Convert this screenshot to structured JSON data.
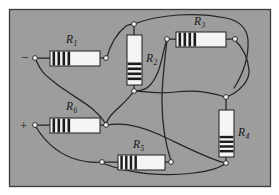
{
  "figure": {
    "panel": {
      "background_color": "#9d9d9d",
      "border_color": "#3c3c3c",
      "outer_background_color": "#ffffff",
      "x": 9,
      "y": 9,
      "width": 261,
      "height": 177
    },
    "wire_color": "#242424",
    "node_fill_color": "#f2f2f2",
    "node_stroke_color": "#1e1e1e",
    "resistor_body_color": "#f4f4f2",
    "resistor_band_color": "#1c1c1c",
    "resistor_outline_color": "#1e1e1e",
    "lead_color": "#242424"
  },
  "terminals": [
    {
      "id": "terminal-negative",
      "label": "−",
      "name": "negative-terminal",
      "label_x": 21,
      "label_y": 62,
      "node_x": 35,
      "node_y": 58
    },
    {
      "id": "terminal-positive",
      "label": "+",
      "name": "positive-terminal",
      "label_x": 20,
      "label_y": 130,
      "node_x": 35,
      "node_y": 125
    }
  ],
  "resistors": [
    {
      "id": "R1",
      "label": "R",
      "subscript": "1",
      "orientation": "horizontal",
      "x": 50,
      "y": 51,
      "width": 50,
      "height": 15,
      "bands": 4,
      "band_side": "start",
      "label_x": 66,
      "label_y": 43,
      "sub_dx": 8,
      "sub_dy": 3
    },
    {
      "id": "R2",
      "label": "R",
      "subscript": "2",
      "orientation": "vertical",
      "x": 127,
      "y": 35,
      "width": 15,
      "height": 50,
      "bands": 4,
      "band_side": "end",
      "label_x": 146,
      "label_y": 62,
      "sub_dx": 8,
      "sub_dy": 3
    },
    {
      "id": "R3",
      "label": "R",
      "subscript": "3",
      "orientation": "horizontal",
      "x": 176,
      "y": 32,
      "width": 50,
      "height": 15,
      "bands": 4,
      "band_side": "start",
      "label_x": 194,
      "label_y": 25,
      "sub_dx": 8,
      "sub_dy": 3
    },
    {
      "id": "R4",
      "label": "R",
      "subscript": "4",
      "orientation": "vertical",
      "x": 219,
      "y": 110,
      "width": 15,
      "height": 47,
      "bands": 4,
      "band_side": "end",
      "label_x": 238,
      "label_y": 136,
      "sub_dx": 8,
      "sub_dy": 3
    },
    {
      "id": "R5",
      "label": "R",
      "subscript": "5",
      "orientation": "horizontal",
      "x": 118,
      "y": 155,
      "width": 47,
      "height": 15,
      "bands": 4,
      "band_side": "start",
      "label_x": 133,
      "label_y": 148,
      "sub_dx": 8,
      "sub_dy": 3
    },
    {
      "id": "R6",
      "label": "R",
      "subscript": "6",
      "orientation": "horizontal",
      "x": 50,
      "y": 118,
      "width": 50,
      "height": 15,
      "bands": 4,
      "band_side": "start",
      "label_x": 66,
      "label_y": 110,
      "sub_dx": 8,
      "sub_dy": 3
    }
  ],
  "nodes": [
    {
      "id": "n-neg",
      "name": "node-negative-terminal",
      "x": 35,
      "y": 58
    },
    {
      "id": "n-r1-right",
      "name": "node-r1-right",
      "x": 106,
      "y": 58
    },
    {
      "id": "n-top-center",
      "name": "node-top-center",
      "x": 134,
      "y": 24
    },
    {
      "id": "n-r2-bottom",
      "name": "node-r2-bottom",
      "x": 134,
      "y": 91
    },
    {
      "id": "n-r3-left",
      "name": "node-r3-left",
      "x": 167,
      "y": 39
    },
    {
      "id": "n-r3-right",
      "name": "node-r3-right",
      "x": 235,
      "y": 39
    },
    {
      "id": "n-r4-top",
      "name": "node-r4-top",
      "x": 226,
      "y": 97
    },
    {
      "id": "n-r4-bottom",
      "name": "node-r4-bottom",
      "x": 226,
      "y": 163
    },
    {
      "id": "n-pos",
      "name": "node-positive-terminal",
      "x": 35,
      "y": 125
    },
    {
      "id": "n-r6-right",
      "name": "node-r6-right",
      "x": 106,
      "y": 125
    },
    {
      "id": "n-r5-left",
      "name": "node-r5-left",
      "x": 102,
      "y": 162
    },
    {
      "id": "n-r5-right",
      "name": "node-r5-right",
      "x": 171,
      "y": 162
    }
  ],
  "wires": [
    {
      "id": "w-neg-r1",
      "name": "wire-negative-to-r1",
      "path": "M 35 58 L 50 58"
    },
    {
      "id": "w-r1-node",
      "name": "wire-r1-to-right-node",
      "path": "M 100 58 L 106 58"
    },
    {
      "id": "w-neg-down",
      "name": "wire-negative-down-to-r6-node",
      "path": "M 36 60 C 42 74 46 76 62 88 C 82 102 96 108 106 124"
    },
    {
      "id": "w-r1node-up",
      "name": "wire-r1node-to-top-center",
      "path": "M 107 57 C 110 46 116 34 126 26 C 129 24 131 24 134 24"
    },
    {
      "id": "w-top-arc",
      "name": "wire-top-center-arc-right",
      "path": "M 134 24 C 160 14 196 12 226 18 C 240 21 247 28 248 40 C 249 58 243 74 234 88"
    },
    {
      "id": "w-r2-top",
      "name": "wire-r2-top-lead",
      "path": "M 134 24 L 134 35"
    },
    {
      "id": "w-r2-bot",
      "name": "wire-r2-bottom-lead",
      "path": "M 134 85 L 134 91"
    },
    {
      "id": "w-r2node-right",
      "name": "wire-r2node-to-r3left",
      "path": "M 135 91 C 146 91 152 86 158 72 C 163 58 164 46 167 40"
    },
    {
      "id": "w-r2node-left",
      "name": "wire-r2node-down-to-r6node",
      "path": "M 133 92 C 128 100 120 106 114 112 C 110 116 107 120 106 125"
    },
    {
      "id": "w-r3-left-lead",
      "name": "wire-r3-left-lead",
      "path": "M 167 39 L 176 39"
    },
    {
      "id": "w-r3-right-lead",
      "name": "wire-r3-right-lead",
      "path": "M 226 39 L 235 39"
    },
    {
      "id": "w-r3right-down",
      "name": "wire-r3right-to-r4top",
      "path": "M 235 40 C 243 48 248 58 249 70 C 250 82 238 92 227 97"
    },
    {
      "id": "w-r3left-down",
      "name": "wire-r3left-down-to-r5right",
      "path": "M 167 40 C 165 58 162 80 162 100 C 162 124 166 146 171 161"
    },
    {
      "id": "w-r4-top-lead",
      "name": "wire-r4-top-lead",
      "path": "M 226 97 L 226 110"
    },
    {
      "id": "w-r4-bot-lead",
      "name": "wire-r4-bottom-lead",
      "path": "M 226 157 L 226 163"
    },
    {
      "id": "w-r4top-left",
      "name": "wire-r4top-to-r2node",
      "path": "M 225 97 C 210 92 192 90 176 92 C 160 94 146 92 136 91"
    },
    {
      "id": "w-pos-r6",
      "name": "wire-positive-to-r6",
      "path": "M 35 125 L 50 125"
    },
    {
      "id": "w-r6-node",
      "name": "wire-r6-to-right-node",
      "path": "M 100 125 L 106 125"
    },
    {
      "id": "w-pos-down",
      "name": "wire-positive-down-to-r5left",
      "path": "M 36 127 C 44 140 56 152 72 158 C 84 162 94 163 102 162"
    },
    {
      "id": "w-r5-left-lead",
      "name": "wire-r5-left-lead",
      "path": "M 102 162 L 118 162"
    },
    {
      "id": "w-r5-right-lead",
      "name": "wire-r5-right-lead",
      "path": "M 165 162 L 171 162"
    },
    {
      "id": "w-r5left-bottom",
      "name": "wire-r5left-bottom-arc-to-r4bottom",
      "path": "M 102 163 C 130 174 164 177 194 173 C 210 171 220 168 226 163"
    },
    {
      "id": "w-r6node-right",
      "name": "wire-r6node-to-r4bottom",
      "path": "M 107 125 C 124 122 140 126 158 134 C 184 146 206 158 225 163"
    }
  ]
}
